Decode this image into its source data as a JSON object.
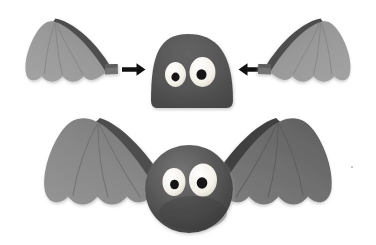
{
  "scene": {
    "title": "Bat craft assembly diagram",
    "description": "Two-row craft instruction image showing a felt bat's parts and the finished bat",
    "background_color": "#ffffff",
    "width": 376,
    "height": 245
  },
  "palette": {
    "background": "#ffffff",
    "body_dark_gray": "#565656",
    "body_shadow": "#3f3f3f",
    "body_highlight": "#6d6d6d",
    "wing_membrane_light": "#9a9a9a",
    "wing_membrane_mid": "#8d8d8d",
    "wing_edge_dark": "#4e4e4e",
    "wing_vein": "#7e7e7e",
    "eye_white": "#f6f4ee",
    "pupil_black": "#161616",
    "arrow_black": "#111111",
    "drop_shadow": "#e4e4e4"
  },
  "rows": [
    {
      "id": "exploded-row",
      "name": "exploded parts row",
      "caption": "Separate bat parts: left wing, head with eyes, right wing",
      "parts": [
        {
          "id": "top-left-wing",
          "name": "left wing piece",
          "side": "left",
          "fill": "#9a9a9a",
          "edge_fill": "#4e4e4e",
          "scallops": 3,
          "has_attach_tab": true
        },
        {
          "id": "top-head",
          "name": "bat head dome piece",
          "shape": "dome",
          "fill": "#565656"
        },
        {
          "id": "top-right-wing",
          "name": "right wing piece",
          "side": "right",
          "fill": "#9a9a9a",
          "edge_fill": "#4e4e4e",
          "scallops": 3,
          "has_attach_tab": true
        }
      ],
      "arrows": [
        {
          "id": "arrow-left-to-head",
          "name": "assembly arrow pointing right",
          "direction": "right",
          "glyph": "→",
          "color": "#111111"
        },
        {
          "id": "arrow-right-to-head",
          "name": "assembly arrow pointing left",
          "direction": "left",
          "glyph": "←",
          "color": "#111111"
        }
      ],
      "eyes": [
        {
          "id": "top-eye-left",
          "name": "left eye",
          "sclera": "#f6f4ee",
          "pupil": "#161616",
          "size": "small"
        },
        {
          "id": "top-eye-right",
          "name": "right eye",
          "sclera": "#f6f4ee",
          "pupil": "#161616",
          "size": "large"
        }
      ]
    },
    {
      "id": "assembled-row",
      "name": "assembled bat row",
      "caption": "Finished bat with both wings attached to the round body",
      "parts": [
        {
          "id": "bottom-left-wing",
          "name": "assembled left wing",
          "side": "left",
          "fill": "#8d8d8d",
          "edge_fill": "#4e4e4e",
          "scallops": 3,
          "has_veins": true
        },
        {
          "id": "bottom-body",
          "name": "bat body sphere",
          "shape": "sphere",
          "fill": "#565656",
          "has_shadow": true
        },
        {
          "id": "bottom-right-wing",
          "name": "assembled right wing",
          "side": "right",
          "fill": "#6b6b6b",
          "edge_fill": "#4e4e4e",
          "scallops": 3,
          "has_veins": true
        }
      ],
      "eyes": [
        {
          "id": "bottom-eye-left",
          "name": "left eye",
          "sclera": "#f6f4ee",
          "pupil": "#161616",
          "size": "small"
        },
        {
          "id": "bottom-eye-right",
          "name": "right eye",
          "sclera": "#f6f4ee",
          "pupil": "#161616",
          "size": "large"
        }
      ]
    }
  ]
}
